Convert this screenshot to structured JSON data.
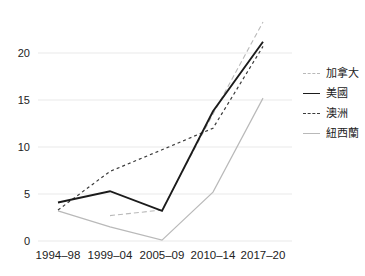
{
  "chart_data": {
    "type": "line",
    "title": "",
    "xlabel": "",
    "ylabel": "",
    "categories": [
      "1994–98",
      "1999–04",
      "2005–09",
      "2010–14",
      "2017–20"
    ],
    "series": [
      {
        "name": "加拿大",
        "color": "#b9b9b9",
        "line_style": "dashed",
        "line_width": 1.1,
        "dash": "5 3",
        "values": [
          null,
          2.7,
          3.3,
          13.5,
          23.3
        ]
      },
      {
        "name": "美國",
        "color": "#1b1b1b",
        "line_style": "solid",
        "line_width": 1.9,
        "dash": "",
        "values": [
          4.1,
          5.3,
          3.2,
          13.8,
          21.2
        ]
      },
      {
        "name": "澳洲",
        "color": "#3c3c3c",
        "line_style": "dashed",
        "line_width": 1.2,
        "dash": "3 3",
        "values": [
          3.3,
          7.4,
          9.7,
          12,
          20.7
        ]
      },
      {
        "name": "紐西蘭",
        "color": "#b9b9b9",
        "line_style": "solid",
        "line_width": 1.2,
        "dash": "",
        "values": [
          3.2,
          1.5,
          0.1,
          5.2,
          15.2
        ]
      }
    ],
    "yticks": [
      0,
      5,
      10,
      15,
      20
    ],
    "ylim": [
      0,
      23.5
    ],
    "grid": true,
    "grid_color": "#e9e9e9",
    "tick_label_color": "#222222",
    "legend_position": "right",
    "background": "#ffffff"
  }
}
